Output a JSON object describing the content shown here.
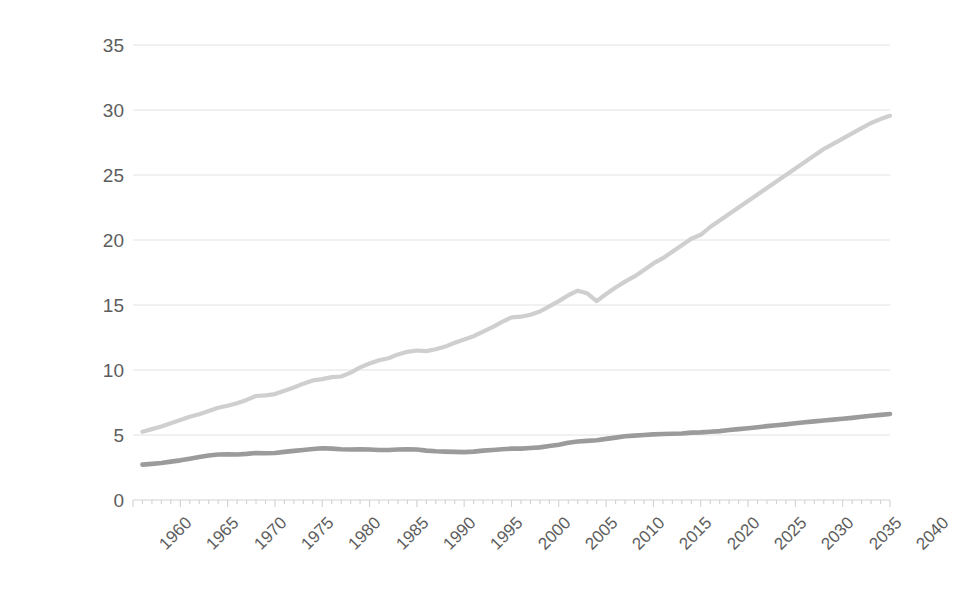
{
  "chart_data": {
    "type": "line",
    "title": "",
    "subtitle": "",
    "xlabel": "",
    "ylabel": "Thousands of 2017 US$",
    "xlim": [
      1960,
      2040
    ],
    "ylim": [
      0,
      35
    ],
    "grid": true,
    "legend_position": "none",
    "x_tick_labels": [
      "1960",
      "1965",
      "1970",
      "1975",
      "1980",
      "1985",
      "1990",
      "1995",
      "2000",
      "2005",
      "2010",
      "2015",
      "2020",
      "2025",
      "2030",
      "2035",
      "2040"
    ],
    "x_tick_values": [
      1960,
      1965,
      1970,
      1975,
      1980,
      1985,
      1990,
      1995,
      2000,
      2005,
      2010,
      2015,
      2020,
      2025,
      2030,
      2035,
      2040
    ],
    "y_tick_labels": [
      "0",
      "5",
      "10",
      "15",
      "20",
      "25",
      "30",
      "35"
    ],
    "y_tick_values": [
      0,
      5,
      10,
      15,
      20,
      25,
      30,
      35
    ],
    "x": [
      1961,
      1962,
      1963,
      1964,
      1965,
      1966,
      1967,
      1968,
      1969,
      1970,
      1971,
      1972,
      1973,
      1974,
      1975,
      1976,
      1977,
      1978,
      1979,
      1980,
      1981,
      1982,
      1983,
      1984,
      1985,
      1986,
      1987,
      1988,
      1989,
      1990,
      1991,
      1992,
      1993,
      1994,
      1995,
      1996,
      1997,
      1998,
      1999,
      2000,
      2001,
      2002,
      2003,
      2004,
      2005,
      2006,
      2007,
      2008,
      2009,
      2010,
      2011,
      2012,
      2013,
      2014,
      2015,
      2016,
      2017,
      2018,
      2019,
      2020,
      2021,
      2022,
      2023,
      2024,
      2025,
      2026,
      2027,
      2028,
      2029,
      2030,
      2031,
      2032,
      2033,
      2034,
      2035,
      2036,
      2037,
      2038,
      2039,
      2040
    ],
    "series": [
      {
        "name": "upper-series",
        "color": "#cfcfcf",
        "width": 4.2,
        "values": [
          5.25,
          5.45,
          5.65,
          5.9,
          6.15,
          6.4,
          6.6,
          6.85,
          7.1,
          7.25,
          7.45,
          7.7,
          8.0,
          8.05,
          8.15,
          8.4,
          8.65,
          8.95,
          9.2,
          9.3,
          9.45,
          9.5,
          9.8,
          10.2,
          10.5,
          10.75,
          10.9,
          11.2,
          11.4,
          11.5,
          11.45,
          11.6,
          11.8,
          12.1,
          12.35,
          12.6,
          12.95,
          13.3,
          13.7,
          14.05,
          14.1,
          14.25,
          14.5,
          14.9,
          15.3,
          15.75,
          16.1,
          15.9,
          15.3,
          15.85,
          16.35,
          16.8,
          17.2,
          17.7,
          18.2,
          18.6,
          19.1,
          19.6,
          20.1,
          20.4,
          21.0,
          21.5,
          22.0,
          22.5,
          23.0,
          23.5,
          24.0,
          24.5,
          25.0,
          25.5,
          26.0,
          26.5,
          27.0,
          27.4,
          27.8,
          28.2,
          28.6,
          29.0,
          29.3,
          29.55
        ]
      },
      {
        "name": "lower-series",
        "color": "#9b9b9b",
        "width": 4.6,
        "values": [
          2.72,
          2.78,
          2.85,
          2.95,
          3.05,
          3.18,
          3.3,
          3.42,
          3.5,
          3.52,
          3.5,
          3.55,
          3.62,
          3.6,
          3.62,
          3.7,
          3.78,
          3.85,
          3.92,
          3.98,
          3.95,
          3.9,
          3.88,
          3.9,
          3.88,
          3.85,
          3.85,
          3.88,
          3.9,
          3.88,
          3.8,
          3.75,
          3.72,
          3.7,
          3.68,
          3.72,
          3.8,
          3.85,
          3.9,
          3.95,
          3.95,
          4.0,
          4.05,
          4.15,
          4.25,
          4.4,
          4.5,
          4.55,
          4.6,
          4.7,
          4.8,
          4.9,
          4.95,
          5.0,
          5.05,
          5.08,
          5.1,
          5.12,
          5.18,
          5.2,
          5.25,
          5.3,
          5.38,
          5.45,
          5.52,
          5.6,
          5.68,
          5.75,
          5.82,
          5.9,
          5.98,
          6.05,
          6.12,
          6.18,
          6.25,
          6.32,
          6.4,
          6.48,
          6.55,
          6.62
        ]
      }
    ]
  }
}
